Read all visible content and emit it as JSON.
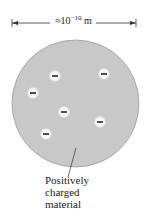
{
  "scale_bar": {
    "prefix": "≈10",
    "exponent": "−10",
    "unit": " m"
  },
  "atom": {
    "fill_color": "#c8c8c8",
    "edge_color": "#9a9a9a",
    "electron_symbol": "−",
    "electron_count": 6
  },
  "caption": {
    "line1": "Positively",
    "line2": "charged",
    "line3": "material"
  }
}
